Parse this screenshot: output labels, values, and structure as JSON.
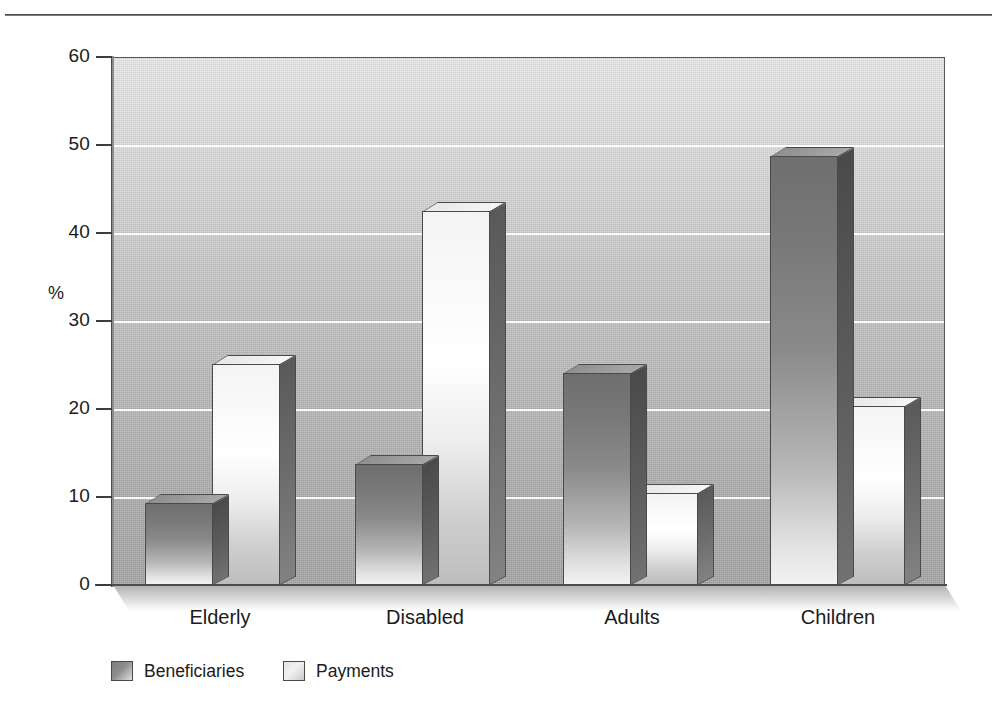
{
  "chart_data": {
    "type": "bar",
    "title": "",
    "subtitle": "",
    "xlabel": "",
    "ylabel": "%",
    "ylim": [
      0,
      60
    ],
    "yticks": [
      0,
      10,
      20,
      30,
      40,
      50,
      60
    ],
    "ytick_labels": [
      "0",
      "10",
      "20",
      "30",
      "40",
      "50",
      "60"
    ],
    "grid": "horizontal",
    "grid_values": [
      10,
      20,
      30,
      40,
      50
    ],
    "legend_position": "bottom-left",
    "categories": [
      "Elderly",
      "Disabled",
      "Adults",
      "Children"
    ],
    "series": [
      {
        "name": "Beneficiaries",
        "color": "#8a8a8a",
        "values": [
          9.3,
          13.8,
          24.1,
          48.8
        ]
      },
      {
        "name": "Payments",
        "color": "#f2f2f2",
        "values": [
          25.1,
          42.5,
          10.5,
          20.3
        ]
      }
    ],
    "style": "3d-bar",
    "plot_background": "#c6c6c6",
    "axis_color": "#4d4d4d",
    "gridline_color": "#ffffff"
  },
  "axis": {
    "y_title": "%",
    "tick_labels": [
      "60",
      "50",
      "40",
      "30",
      "20",
      "10",
      "0"
    ]
  },
  "category_labels": [
    "Elderly",
    "Disabled",
    "Adults",
    "Children"
  ],
  "legend": {
    "items": [
      {
        "label": "Beneficiaries",
        "swatch": "dark"
      },
      {
        "label": "Payments",
        "swatch": "light"
      }
    ]
  }
}
